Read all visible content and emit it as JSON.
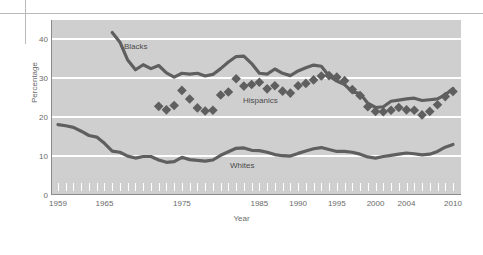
{
  "chart_data": {
    "type": "line",
    "title": "",
    "xlabel": "Year",
    "ylabel": "Percentage",
    "xlim": [
      1959,
      2010
    ],
    "ylim": [
      0,
      45
    ],
    "yticks": [
      0,
      10,
      20,
      30,
      40
    ],
    "xticks_labeled": [
      1959,
      1965,
      1975,
      1985,
      1990,
      1995,
      2000,
      2004,
      2010
    ],
    "grid": "horizontal-white-gridlines",
    "legend": "inline-series-labels",
    "plot_background": "#cfcfcf",
    "gridline_color": "#ffffff",
    "line_color": "#5f5f5f",
    "marker_color": "#5f5f5f",
    "x": [
      1959,
      1960,
      1961,
      1962,
      1963,
      1964,
      1965,
      1966,
      1967,
      1968,
      1969,
      1970,
      1971,
      1972,
      1973,
      1974,
      1975,
      1976,
      1977,
      1978,
      1979,
      1980,
      1981,
      1982,
      1983,
      1984,
      1985,
      1986,
      1987,
      1988,
      1989,
      1990,
      1991,
      1992,
      1993,
      1994,
      1995,
      1996,
      1997,
      1998,
      1999,
      2000,
      2001,
      2002,
      2003,
      2004,
      2005,
      2006,
      2007,
      2008,
      2009,
      2010
    ],
    "series": [
      {
        "name": "Blacks",
        "style": "solid-line",
        "label_text": "Blacks",
        "x_start": 1966,
        "values": [
          null,
          null,
          null,
          null,
          null,
          null,
          null,
          41.8,
          39.3,
          34.7,
          32.2,
          33.5,
          32.5,
          33.3,
          31.4,
          30.3,
          31.3,
          31.1,
          31.3,
          30.6,
          31.0,
          32.5,
          34.2,
          35.6,
          35.7,
          33.8,
          31.3,
          31.1,
          32.4,
          31.3,
          30.7,
          31.9,
          32.7,
          33.4,
          33.1,
          30.6,
          29.3,
          28.4,
          26.5,
          26.1,
          23.6,
          22.5,
          22.7,
          24.1,
          24.4,
          24.7,
          24.9,
          24.3,
          24.5,
          24.7,
          25.8,
          27.4
        ]
      },
      {
        "name": "Hispanics",
        "style": "diamond-markers",
        "label_text": "Hispanics",
        "x_start": 1972,
        "values": [
          null,
          null,
          null,
          null,
          null,
          null,
          null,
          null,
          null,
          null,
          null,
          null,
          null,
          22.8,
          21.9,
          23.0,
          26.9,
          24.7,
          22.4,
          21.6,
          21.8,
          25.7,
          26.5,
          29.9,
          28.0,
          28.4,
          29.0,
          27.3,
          28.1,
          26.7,
          26.2,
          28.1,
          28.7,
          29.6,
          30.6,
          30.7,
          30.3,
          29.4,
          27.1,
          25.6,
          22.7,
          21.5,
          21.4,
          21.8,
          22.5,
          21.9,
          21.8,
          20.6,
          21.5,
          23.2,
          25.3,
          26.6
        ]
      },
      {
        "name": "Whites",
        "style": "solid-line",
        "label_text": "Whites",
        "x_start": 1959,
        "values": [
          18.1,
          17.8,
          17.4,
          16.4,
          15.3,
          14.9,
          13.3,
          11.3,
          11.0,
          10.0,
          9.5,
          9.9,
          9.9,
          9.0,
          8.4,
          8.6,
          9.7,
          9.1,
          8.9,
          8.7,
          9.0,
          10.2,
          11.1,
          12.0,
          12.1,
          11.5,
          11.4,
          11.0,
          10.4,
          10.1,
          10.0,
          10.7,
          11.3,
          11.9,
          12.2,
          11.7,
          11.2,
          11.2,
          11.0,
          10.5,
          9.8,
          9.5,
          9.9,
          10.2,
          10.5,
          10.8,
          10.6,
          10.3,
          10.5,
          11.2,
          12.3,
          13.0
        ]
      }
    ]
  },
  "axes": {
    "ylabel_text": "Percentage",
    "xtitle_text": "Year",
    "ytick_labels": [
      "40",
      "30",
      "20",
      "10",
      "0"
    ],
    "xtick_labels": [
      "1959",
      "1965",
      "1975",
      "1985",
      "1990",
      "1995",
      "2000",
      "2004",
      "2010"
    ]
  }
}
